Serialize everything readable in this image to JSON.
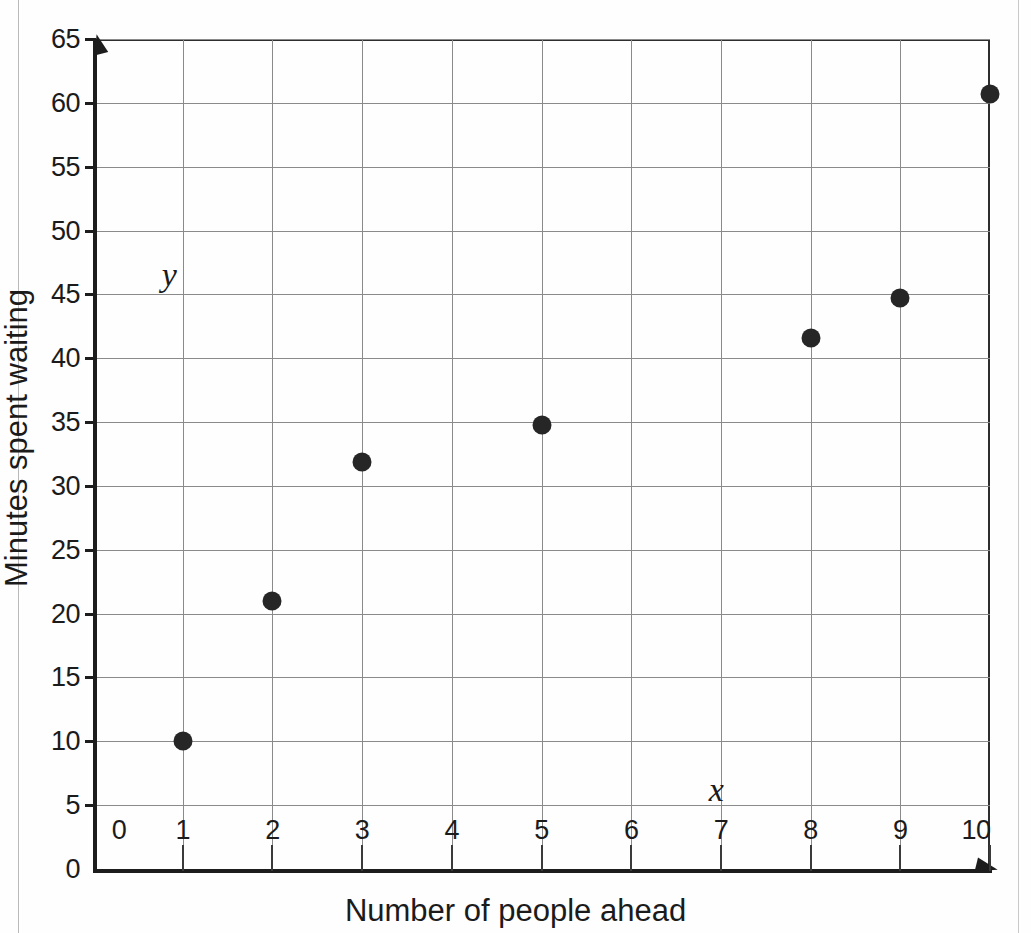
{
  "chart_data": {
    "type": "scatter",
    "title": "",
    "xlabel": "Number of people ahead",
    "ylabel": "Minutes spent waiting",
    "xlim": [
      0,
      10
    ],
    "ylim": [
      0,
      65
    ],
    "grid": true,
    "legend": null,
    "x_ticks": [
      "0",
      "1",
      "2",
      "3",
      "4",
      "5",
      "6",
      "7",
      "8",
      "9",
      "10"
    ],
    "y_ticks": [
      "0",
      "5",
      "10",
      "15",
      "20",
      "25",
      "30",
      "35",
      "40",
      "45",
      "50",
      "55",
      "60",
      "65"
    ],
    "x": [
      1,
      2,
      3,
      5,
      8,
      9,
      10
    ],
    "y": [
      10,
      21,
      31.9,
      34.8,
      41.6,
      44.7,
      60.7
    ],
    "points": [
      {
        "x": 1,
        "y": 10
      },
      {
        "x": 2,
        "y": 21
      },
      {
        "x": 3,
        "y": 31.9
      },
      {
        "x": 5,
        "y": 34.8
      },
      {
        "x": 8,
        "y": 41.6
      },
      {
        "x": 9,
        "y": 44.7
      },
      {
        "x": 10,
        "y": 60.7
      }
    ],
    "annotations": [
      {
        "text": "y",
        "x": 0.85,
        "y": 46.5,
        "style": "italic-serif"
      },
      {
        "text": "x",
        "x": 6.95,
        "y": 6.2,
        "style": "italic-serif"
      }
    ],
    "marker_color": "#262626",
    "grid_color": "#8a8a8a",
    "axis_color": "#1d1d1d"
  },
  "page": {
    "top_clipped_text": "",
    "background": "#ffffff"
  }
}
